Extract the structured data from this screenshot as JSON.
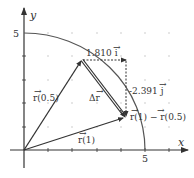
{
  "diagram": {
    "axes": {
      "x_label": "x",
      "y_label": "y",
      "x_tick_label": "5",
      "y_tick_label": "5"
    },
    "labels": {
      "r_half": "r(0.5)",
      "r_one": "r(1)",
      "delta_r": "Δr",
      "horizontal_component": "1.810 i",
      "vertical_component": "-2.391 j",
      "difference": "r(1) − r(0.5)"
    },
    "vector_symbol": "→",
    "colors": {
      "stroke": "#333333",
      "curve": "#555555",
      "grid_dot": "#bbbbbb",
      "background": "#ffffff"
    }
  }
}
